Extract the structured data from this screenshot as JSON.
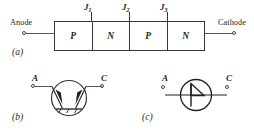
{
  "figure": {
    "caption_a": "(a)",
    "caption_b": "(b)",
    "caption_c": "(c)"
  },
  "structure": {
    "anode_label": "Anode",
    "cathode_label": "Cathode",
    "layers": [
      {
        "name": "P"
      },
      {
        "name": "N"
      },
      {
        "name": "P"
      },
      {
        "name": "N"
      }
    ],
    "junctions": [
      {
        "name": "J",
        "index": "1"
      },
      {
        "name": "J",
        "index": "2"
      },
      {
        "name": "J",
        "index": "3"
      }
    ]
  },
  "symbol_b": {
    "name": "two-transistor-equivalent",
    "anode_label": "A",
    "cathode_label": "C"
  },
  "symbol_c": {
    "name": "scr-schematic-symbol",
    "anode_label": "A",
    "cathode_label": "C"
  },
  "colors": {
    "ink": "#231f1e",
    "line": "#3a3634",
    "wire": "#5a5654",
    "background": "#ffffff"
  }
}
